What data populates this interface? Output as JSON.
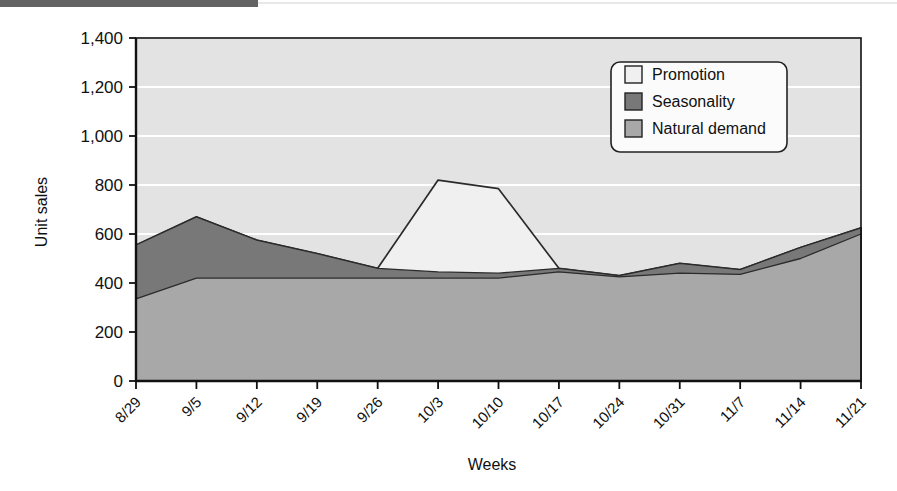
{
  "figure": {
    "top_bar_color": "#636363",
    "plot_background": "#e3e3e3",
    "gridline_color": "#ffffff",
    "axis_color": "#111111"
  },
  "axes": {
    "ylabel": "Unit sales",
    "xlabel": "Weeks",
    "yticks": [
      "0",
      "200",
      "400",
      "600",
      "800",
      "1,000",
      "1,200",
      "1,400"
    ],
    "ylim": [
      0,
      1400
    ],
    "grid": true
  },
  "legend": {
    "position": "top-right-inside",
    "items": [
      {
        "label": "Promotion",
        "color": "#f0f0f0"
      },
      {
        "label": "Seasonality",
        "color": "#787878"
      },
      {
        "label": "Natural demand",
        "color": "#a8a8a8"
      }
    ]
  },
  "chart_data": {
    "type": "area",
    "stacked": false,
    "title": "",
    "xlabel": "Weeks",
    "ylabel": "Unit sales",
    "ylim": [
      0,
      1400
    ],
    "yticks": [
      0,
      200,
      400,
      600,
      800,
      1000,
      1200,
      1400
    ],
    "grid": true,
    "legend_position": "top-right-inside",
    "categories": [
      "8/29",
      "9/5",
      "9/12",
      "9/19",
      "9/26",
      "10/3",
      "10/10",
      "10/17",
      "10/24",
      "10/31",
      "11/7",
      "11/14",
      "11/21"
    ],
    "series": [
      {
        "name": "Natural demand",
        "color": "#a8a8a8",
        "values": [
          335,
          420,
          420,
          420,
          420,
          420,
          420,
          445,
          425,
          440,
          435,
          500,
          600
        ]
      },
      {
        "name": "Seasonality",
        "color": "#787878",
        "values": [
          555,
          670,
          575,
          520,
          460,
          445,
          440,
          460,
          430,
          480,
          455,
          545,
          625
        ]
      },
      {
        "name": "Promotion",
        "color": "#f0f0f0",
        "values": [
          555,
          670,
          575,
          520,
          460,
          820,
          785,
          460,
          430,
          480,
          455,
          545,
          625
        ]
      }
    ]
  }
}
